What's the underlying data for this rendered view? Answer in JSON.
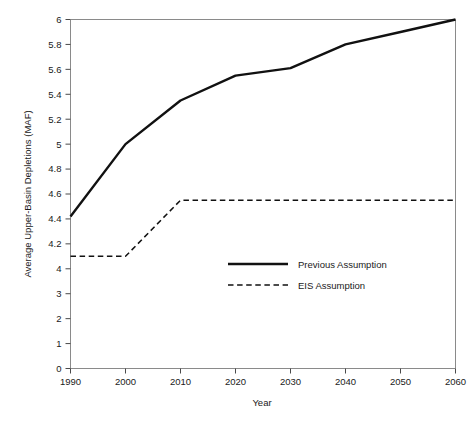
{
  "chart_data": {
    "type": "line",
    "title": "",
    "xlabel": "Year",
    "ylabel": "Average Upper-Basin Depletions (MAF)",
    "grid": false,
    "legend_position": "center-right-inside",
    "x": [
      1990,
      2000,
      2010,
      2020,
      2030,
      2040,
      2050,
      2060
    ],
    "xlim": [
      1990,
      2060
    ],
    "xtick_labels": [
      "1990",
      "2000",
      "2010",
      "2020",
      "2030",
      "2040",
      "2050",
      "2060"
    ],
    "ytick_labels": [
      "0",
      "1",
      "2",
      "3",
      "4",
      "4.2",
      "4.4",
      "4.6",
      "4.8",
      "5",
      "5.2",
      "5.4",
      "5.6",
      "5.8",
      "6"
    ],
    "ytick_values": [
      0,
      1,
      2,
      3,
      4,
      4.2,
      4.4,
      4.6,
      4.8,
      5,
      5.2,
      5.4,
      5.6,
      5.8,
      6
    ],
    "y_axis_note": "broken non-linear axis: 0-4 in unit steps, then 4.0-6.0 in 0.2 steps, all ticks equally spaced",
    "ylim": [
      0,
      6
    ],
    "series": [
      {
        "name": "Previous Assumption",
        "style": "solid",
        "color": "#111111",
        "values": [
          4.42,
          5.0,
          5.35,
          5.55,
          5.61,
          5.8,
          5.9,
          6.0
        ]
      },
      {
        "name": "EIS Assumption",
        "style": "dashed",
        "color": "#111111",
        "values": [
          4.1,
          4.1,
          4.55,
          4.55,
          4.55,
          4.55,
          4.55,
          4.55
        ]
      }
    ]
  },
  "legend": {
    "entries": [
      {
        "label": "Previous Assumption",
        "style": "solid"
      },
      {
        "label": "EIS Assumption",
        "style": "dashed"
      }
    ]
  },
  "axes": {
    "x_title": "Year",
    "y_title": "Average Upper-Basin Depletions (MAF)"
  }
}
